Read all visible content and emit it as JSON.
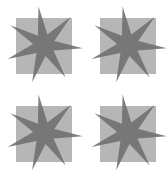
{
  "canvas": {
    "width": 168,
    "height": 176,
    "background_color": "#ffffff"
  },
  "grid": {
    "columns": 2,
    "rows": 4,
    "total_tiles": 4,
    "cell_width": 84,
    "cell_height": 88
  },
  "tile": {
    "square": {
      "x": 16,
      "y": 18,
      "size": 56,
      "fill_color": "#b6b6b6"
    },
    "star": {
      "points": 7,
      "center_x": 44,
      "center_y": 45,
      "outer_radius": 39,
      "inner_radius": 11,
      "rotation_deg": -8,
      "fill_color": "#6e6e6e",
      "opacity": 0.88
    }
  },
  "tiles": [
    {
      "id": "tile-1",
      "row": 0,
      "col": 0,
      "offset_x": 0,
      "offset_y": 0
    },
    {
      "id": "tile-2",
      "row": 0,
      "col": 1,
      "offset_x": 84,
      "offset_y": 0
    },
    {
      "id": "tile-3",
      "row": 1,
      "col": 0,
      "offset_x": 0,
      "offset_y": 88
    },
    {
      "id": "tile-4",
      "row": 1,
      "col": 1,
      "offset_x": 84,
      "offset_y": 88
    }
  ]
}
